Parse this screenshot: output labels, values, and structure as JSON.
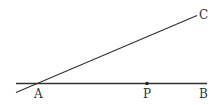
{
  "diagram": {
    "points": {
      "A": {
        "label": "A"
      },
      "P": {
        "label": "P"
      },
      "B": {
        "label": "B"
      },
      "C": {
        "label": "C"
      }
    },
    "segments": [
      {
        "name": "line-AB",
        "from": "A",
        "to": "B"
      },
      {
        "name": "line-AC",
        "from": "A",
        "to": "C"
      }
    ],
    "colors": {
      "line": "#333333",
      "background": "#ffffff"
    }
  }
}
